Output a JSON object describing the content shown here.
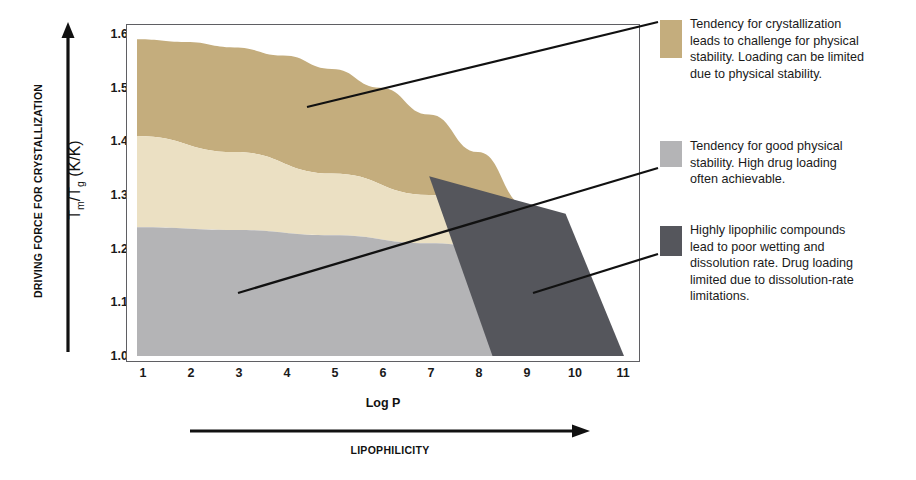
{
  "axes": {
    "y_axis_title": "Tm/Tg (K/K)",
    "y_axis_title_main": "T",
    "y_axis_sub1": "m",
    "y_axis_mid": "/T",
    "y_axis_sub2": "g",
    "y_axis_units": " (K/K)",
    "y_ticks": [
      "1.6",
      "1.5",
      "1.4",
      "1.3",
      "1.2",
      "1.1",
      "1.0"
    ],
    "x_ticks": [
      "1",
      "2",
      "3",
      "4",
      "5",
      "6",
      "7",
      "8",
      "9",
      "10",
      "11"
    ],
    "x_axis_title": "Log P",
    "vertical_arrow_label": "DRIVING FORCE FOR CRYSTALLIZATION",
    "horizontal_arrow_label": "LIPOPHILICITY"
  },
  "legend": [
    {
      "id": "crystallization-region",
      "color": "#c4ad7d",
      "text": "Tendency for crystallization\nleads to challenge for physical\nstability. Loading can be limited\ndue to  physical stability."
    },
    {
      "id": "good-stability-region",
      "color": "#b4b4b6",
      "text": "Tendency for good physical\nstability. High drug loading\noften achievable."
    },
    {
      "id": "lipophilic-region",
      "color": "#55565c",
      "text": "Highly lipophilic compounds\nlead to poor wetting and\ndissolution rate. Drug loading\nlimited due to dissolution-rate\nlimitations."
    }
  ],
  "chart_data": {
    "type": "area",
    "title": "",
    "xlabel": "Log P",
    "ylabel": "Tm/Tg (K/K)",
    "xlim": [
      1,
      11
    ],
    "ylim": [
      1.0,
      1.6
    ],
    "grid": false,
    "legend_position": "right",
    "regions": [
      {
        "name": "Tendency for crystallization",
        "color": "#c4ad7d",
        "description": "Upper tan band: high Tm/Tg, crystallization-prone. Bounded above by a curve falling from 1.59 at Log P 1 to 1.0 near Log P 10.8, and below by the cream band boundary.",
        "upper_boundary": [
          {
            "x": 1,
            "y": 1.59
          },
          {
            "x": 2,
            "y": 1.585
          },
          {
            "x": 3,
            "y": 1.575
          },
          {
            "x": 4,
            "y": 1.56
          },
          {
            "x": 5,
            "y": 1.535
          },
          {
            "x": 6,
            "y": 1.5
          },
          {
            "x": 7,
            "y": 1.45
          },
          {
            "x": 8,
            "y": 1.38
          },
          {
            "x": 9,
            "y": 1.28
          },
          {
            "x": 10,
            "y": 1.15
          },
          {
            "x": 10.8,
            "y": 1.0
          }
        ],
        "lower_boundary": [
          {
            "x": 1,
            "y": 1.41
          },
          {
            "x": 3,
            "y": 1.38
          },
          {
            "x": 5,
            "y": 1.34
          },
          {
            "x": 7,
            "y": 1.3
          },
          {
            "x": 8.8,
            "y": 1.26
          }
        ]
      },
      {
        "name": "Transition band",
        "color": "#ebe0c3",
        "description": "Cream intermediate band between the crystallization band and the good-stability band.",
        "upper_boundary": [
          {
            "x": 1,
            "y": 1.41
          },
          {
            "x": 3,
            "y": 1.38
          },
          {
            "x": 5,
            "y": 1.34
          },
          {
            "x": 7,
            "y": 1.3
          },
          {
            "x": 8.8,
            "y": 1.26
          }
        ],
        "lower_boundary": [
          {
            "x": 1,
            "y": 1.24
          },
          {
            "x": 3,
            "y": 1.235
          },
          {
            "x": 5,
            "y": 1.225
          },
          {
            "x": 7,
            "y": 1.21
          },
          {
            "x": 8.8,
            "y": 1.195
          }
        ]
      },
      {
        "name": "Tendency for good physical stability",
        "color": "#b4b4b6",
        "description": "Lower light-grey band: low driving force for crystallization, high drug loading achievable.",
        "upper_boundary": [
          {
            "x": 1,
            "y": 1.24
          },
          {
            "x": 3,
            "y": 1.235
          },
          {
            "x": 5,
            "y": 1.225
          },
          {
            "x": 7,
            "y": 1.21
          },
          {
            "x": 8.8,
            "y": 1.195
          }
        ],
        "lower_boundary": [
          {
            "x": 1,
            "y": 1.0
          },
          {
            "x": 8.8,
            "y": 1.0
          }
        ]
      },
      {
        "name": "Highly lipophilic compounds",
        "color": "#55565c",
        "description": "Dark grey parallelogram at high Log P overlaying the other bands.",
        "vertices": [
          {
            "x": 7.0,
            "y": 1.335
          },
          {
            "x": 9.8,
            "y": 1.265
          },
          {
            "x": 11.0,
            "y": 1.0
          },
          {
            "x": 8.3,
            "y": 1.0
          }
        ]
      }
    ]
  }
}
